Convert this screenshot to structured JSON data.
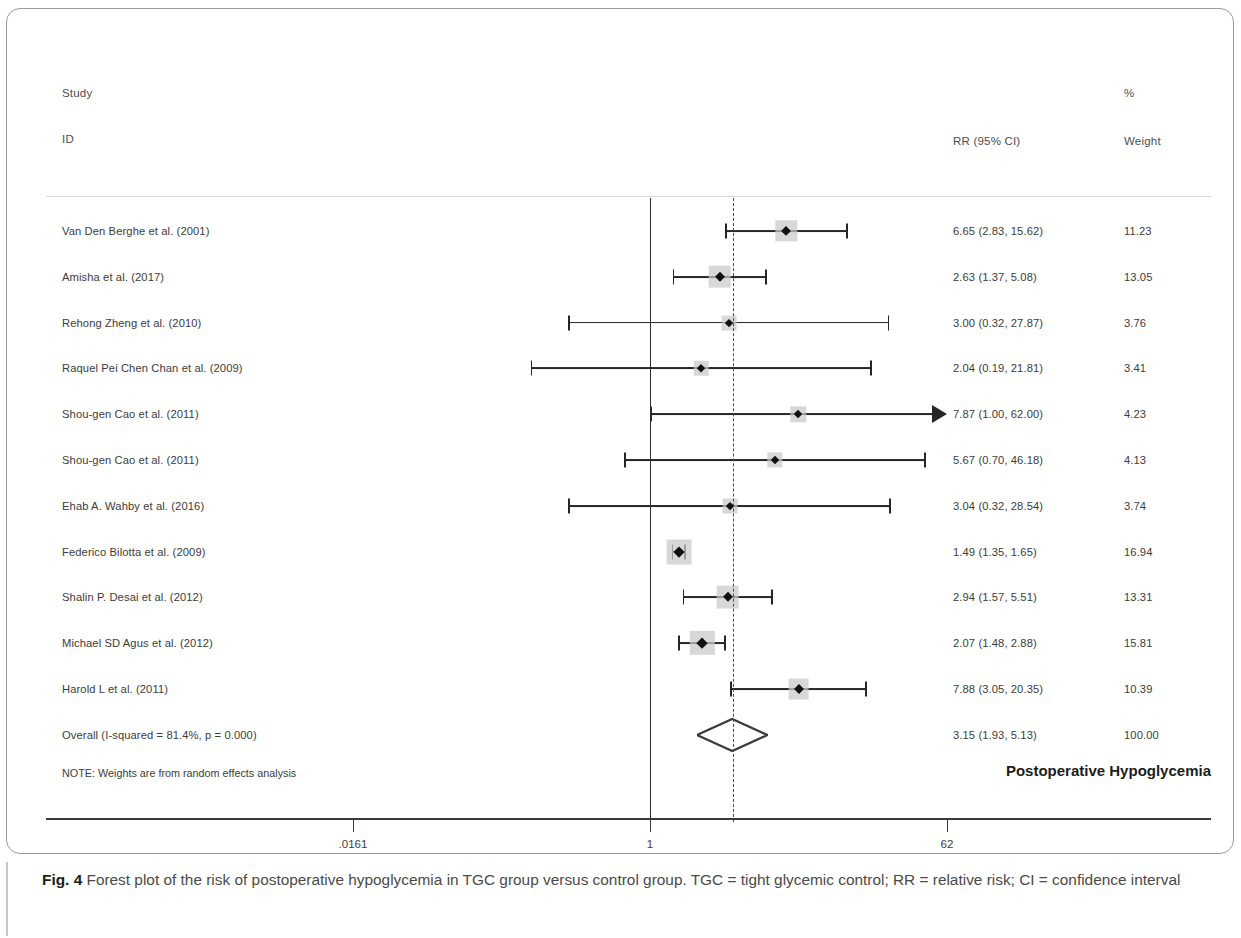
{
  "figure": {
    "caption_label": "Fig. 4",
    "caption_text": " Forest plot of the risk of postoperative hypoglycemia in TGC group versus control group. TGC = tight glycemic control; RR = relative risk; CI = confidence interval"
  },
  "headers": {
    "study": "Study",
    "id": "ID",
    "rr": "RR (95% CI)",
    "percent": "%",
    "weight": "Weight"
  },
  "plot_title": "Postoperative Hypoglycemia",
  "note": "NOTE: Weights are from random effects analysis",
  "axis": {
    "ticks": [
      {
        "label": ".0161",
        "value": 0.0161
      },
      {
        "label": "1",
        "value": 1
      },
      {
        "label": "62",
        "value": 62
      }
    ],
    "null_line": 1,
    "pooled_line": 3.15,
    "scale": "log"
  },
  "chart_data": {
    "type": "forest",
    "title": "Postoperative Hypoglycemia",
    "xlabel": "",
    "ylabel": "",
    "xscale": "log",
    "xlim": [
      0.0161,
      62
    ],
    "effect_measure": "RR (95% CI)",
    "null_value": 1,
    "columns": [
      "Study ID",
      "RR (95% CI)",
      "% Weight"
    ],
    "studies": [
      {
        "id": "Van Den Berghe et al. (2001)",
        "rr": 6.65,
        "lcl": 2.83,
        "ucl": 15.62,
        "ci_text": "6.65 (2.83, 15.62)",
        "weight": 11.23,
        "weight_text": "11.23",
        "truncated_right": false
      },
      {
        "id": "Amisha et al. (2017)",
        "rr": 2.63,
        "lcl": 1.37,
        "ucl": 5.08,
        "ci_text": "2.63 (1.37, 5.08)",
        "weight": 13.05,
        "weight_text": "13.05",
        "truncated_right": false
      },
      {
        "id": "Rehong Zheng et al. (2010)",
        "rr": 3.0,
        "lcl": 0.32,
        "ucl": 27.87,
        "ci_text": "3.00 (0.32, 27.87)",
        "weight": 3.76,
        "weight_text": "3.76",
        "truncated_right": false
      },
      {
        "id": "Raquel Pei Chen Chan et al. (2009)",
        "rr": 2.04,
        "lcl": 0.19,
        "ucl": 21.81,
        "ci_text": "2.04 (0.19, 21.81)",
        "weight": 3.41,
        "weight_text": "3.41",
        "truncated_right": false
      },
      {
        "id": "Shou-gen Cao et al. (2011)",
        "rr": 7.87,
        "lcl": 1.0,
        "ucl": 62.0,
        "ci_text": "7.87 (1.00, 62.00)",
        "weight": 4.23,
        "weight_text": "4.23",
        "truncated_right": true
      },
      {
        "id": "Shou-gen Cao et al. (2011)",
        "rr": 5.67,
        "lcl": 0.7,
        "ucl": 46.18,
        "ci_text": "5.67 (0.70, 46.18)",
        "weight": 4.13,
        "weight_text": "4.13",
        "truncated_right": false
      },
      {
        "id": "Ehab A. Wahby et al. (2016)",
        "rr": 3.04,
        "lcl": 0.32,
        "ucl": 28.54,
        "ci_text": "3.04 (0.32, 28.54)",
        "weight": 3.74,
        "weight_text": "3.74",
        "truncated_right": false
      },
      {
        "id": "Federico Bilotta et al. (2009)",
        "rr": 1.49,
        "lcl": 1.35,
        "ucl": 1.65,
        "ci_text": "1.49 (1.35, 1.65)",
        "weight": 16.94,
        "weight_text": "16.94",
        "truncated_right": false
      },
      {
        "id": "Shalin P. Desai et al. (2012)",
        "rr": 2.94,
        "lcl": 1.57,
        "ucl": 5.51,
        "ci_text": "2.94 (1.57, 5.51)",
        "weight": 13.31,
        "weight_text": "13.31",
        "truncated_right": false
      },
      {
        "id": "Michael SD Agus et al. (2012)",
        "rr": 2.07,
        "lcl": 1.48,
        "ucl": 2.88,
        "ci_text": "2.07 (1.48, 2.88)",
        "weight": 15.81,
        "weight_text": "15.81",
        "truncated_right": false
      },
      {
        "id": "Harold L et al. (2011)",
        "rr": 7.88,
        "lcl": 3.05,
        "ucl": 20.35,
        "ci_text": "7.88 (3.05, 20.35)",
        "weight": 10.39,
        "weight_text": "10.39",
        "truncated_right": false
      }
    ],
    "overall": {
      "id": "Overall  (I-squared = 81.4%, p = 0.000)",
      "rr": 3.15,
      "lcl": 1.93,
      "ucl": 5.13,
      "ci_text": "3.15 (1.93, 5.13)",
      "weight": 100.0,
      "weight_text": "100.00",
      "i_squared": "81.4%",
      "p_value": "0.000"
    },
    "colors": {
      "marker": "#111111",
      "weight_box": "#c9c9c9",
      "line": "#262626",
      "null_line": "#2e2e2e",
      "pooled_line": "#4a4a4a"
    }
  }
}
